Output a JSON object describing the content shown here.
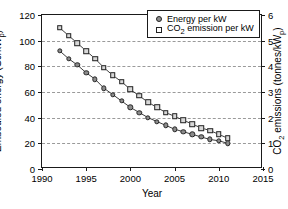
{
  "chart_data": {
    "type": "line",
    "title": "",
    "xlabel": "Year",
    "ylabel": "Embodied energy (GJ/kWp)",
    "ylabel_right": "CO2 emissions (tonnes/kWp)",
    "xlim": [
      1990,
      2015
    ],
    "ylim": [
      0,
      120
    ],
    "ylim_right": [
      0,
      6
    ],
    "xticks": [
      1990,
      1995,
      2000,
      2005,
      2010,
      2015
    ],
    "yticks": [
      0,
      20,
      40,
      60,
      80,
      100,
      120
    ],
    "yticks_right": [
      0,
      1,
      2,
      3,
      4,
      5,
      6
    ],
    "grid": "horizontal-dashed",
    "legend_position": "top-right",
    "x": [
      1992,
      1993,
      1994,
      1995,
      1996,
      1997,
      1998,
      1999,
      2000,
      2001,
      2002,
      2003,
      2004,
      2005,
      2006,
      2007,
      2008,
      2009,
      2010,
      2011
    ],
    "series": [
      {
        "name": "Energy per kW",
        "marker": "circle",
        "axis": "left",
        "units": "GJ/kWp",
        "values": [
          92,
          86,
          81,
          75,
          70,
          63,
          58,
          53,
          48,
          44,
          40,
          37,
          34,
          31,
          29,
          27,
          25,
          23,
          22,
          20
        ]
      },
      {
        "name": "CO2 emission per kW",
        "marker": "square",
        "axis": "right",
        "units": "tonnes/kWp",
        "values": [
          110,
          104,
          98,
          92,
          86,
          79,
          73,
          68,
          62,
          57,
          52,
          48,
          44,
          41,
          38,
          35,
          32,
          30,
          27,
          24
        ],
        "values_right_axis": [
          5.5,
          5.2,
          4.9,
          4.6,
          4.3,
          3.95,
          3.65,
          3.4,
          3.1,
          2.85,
          2.6,
          2.4,
          2.2,
          2.05,
          1.9,
          1.75,
          1.6,
          1.5,
          1.35,
          1.2
        ]
      }
    ],
    "legend": [
      {
        "label": "Energy per kW",
        "marker": "circle"
      },
      {
        "label": "CO2 emission per kW",
        "marker": "square"
      }
    ],
    "colors": {
      "circle_fill": "#8b8b8b",
      "square_fill": "#d8d8d8",
      "marker_edge": "#262626",
      "grid": "#9a9a9a",
      "axis": "#1a1a1a"
    }
  },
  "axis_titles": {
    "left_prefix": "Embodied energy (GJ/kW",
    "left_sub": "p",
    "left_suffix": ")",
    "right_prefix": "CO",
    "right_sub1": "2",
    "right_mid": " emissions (tonnes/kW",
    "right_sub2": "p",
    "right_suffix": ")",
    "x_title": "Year"
  },
  "legend_text": {
    "item1": "Energy per kW",
    "item2_prefix": "CO",
    "item2_sub": "2",
    "item2_suffix": " emission per kW"
  }
}
